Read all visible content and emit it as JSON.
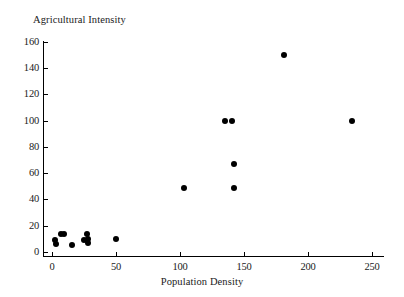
{
  "chart_data": {
    "type": "scatter",
    "title": "",
    "xlabel": "Population Density",
    "ylabel": "Agricultural Intensity",
    "xlim": [
      -7,
      259
    ],
    "ylim": [
      -3,
      160
    ],
    "xticks": [
      0,
      50,
      100,
      150,
      200,
      250
    ],
    "yticks": [
      0,
      20,
      40,
      60,
      80,
      100,
      120,
      140,
      160
    ],
    "grid": false,
    "legend": null,
    "marker": "filled-circle",
    "marker_color": "#000000",
    "points": [
      {
        "x": 2,
        "y": 9
      },
      {
        "x": 3,
        "y": 6
      },
      {
        "x": 7,
        "y": 14
      },
      {
        "x": 9,
        "y": 14
      },
      {
        "x": 16,
        "y": 5
      },
      {
        "x": 25,
        "y": 9
      },
      {
        "x": 27,
        "y": 14
      },
      {
        "x": 28,
        "y": 7
      },
      {
        "x": 28,
        "y": 10
      },
      {
        "x": 50,
        "y": 10
      },
      {
        "x": 103,
        "y": 49
      },
      {
        "x": 135,
        "y": 100
      },
      {
        "x": 141,
        "y": 100
      },
      {
        "x": 142,
        "y": 67
      },
      {
        "x": 142,
        "y": 49
      },
      {
        "x": 181,
        "y": 150
      },
      {
        "x": 234,
        "y": 100
      }
    ]
  }
}
